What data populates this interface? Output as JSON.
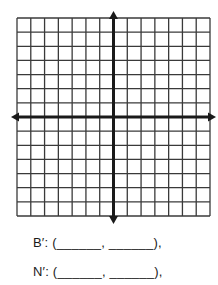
{
  "diagram": {
    "type": "coordinate-plane",
    "grid": {
      "columns": 14,
      "rows": 14,
      "left": 17,
      "top": 18,
      "right": 210,
      "bottom": 216,
      "line_color": "#3a3a3a",
      "axis_color": "#1a1a1a"
    },
    "axes": {
      "x_axis_row_index": 7,
      "y_axis_col_index": 7,
      "arrows": [
        "up",
        "down",
        "left",
        "right"
      ],
      "x_arrow_left": 11,
      "x_arrow_right": 216,
      "y_arrow_top": 11,
      "y_arrow_bottom": 224
    }
  },
  "answers": [
    {
      "label": "B′",
      "text": "B′: (______, ______),"
    },
    {
      "label": "N′",
      "text": "N′: (______, ______),"
    }
  ]
}
